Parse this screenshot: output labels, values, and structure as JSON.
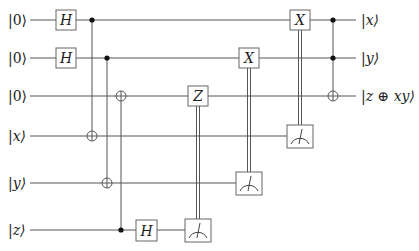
{
  "diagram": {
    "type": "quantum-circuit",
    "colors": {
      "wire": "#555555",
      "gate_border": "#666666",
      "text": "#222222"
    },
    "inputs": [
      "|0⟩",
      "|0⟩",
      "|0⟩",
      "|x⟩",
      "|y⟩",
      "|z⟩"
    ],
    "outputs": [
      "|x⟩",
      "|y⟩",
      "|z ⊕ xy⟩"
    ],
    "wires_y": [
      20,
      58,
      96,
      136,
      183,
      230
    ],
    "gates": [
      {
        "type": "H",
        "wire": 0,
        "x": 66,
        "label": "H"
      },
      {
        "type": "H",
        "wire": 1,
        "x": 66,
        "label": "H"
      },
      {
        "type": "CNOT",
        "control": 0,
        "target": 3,
        "x": 92
      },
      {
        "type": "CNOT",
        "control": 1,
        "target": 4,
        "x": 107
      },
      {
        "type": "CNOT",
        "control": 5,
        "target": 2,
        "x": 121
      },
      {
        "type": "H",
        "wire": 5,
        "x": 146,
        "label": "H"
      },
      {
        "type": "Z",
        "wire": 2,
        "x": 198,
        "label": "Z",
        "classical_control_from": 5
      },
      {
        "type": "measure",
        "wire": 5,
        "x": 198
      },
      {
        "type": "X",
        "wire": 1,
        "x": 249,
        "label": "X",
        "classical_control_from": 4
      },
      {
        "type": "measure",
        "wire": 4,
        "x": 249
      },
      {
        "type": "X",
        "wire": 0,
        "x": 300,
        "label": "X",
        "classical_control_from": 3
      },
      {
        "type": "measure",
        "wire": 3,
        "x": 300
      },
      {
        "type": "Toffoli",
        "controls": [
          0,
          1
        ],
        "target": 2,
        "x": 333
      }
    ]
  }
}
